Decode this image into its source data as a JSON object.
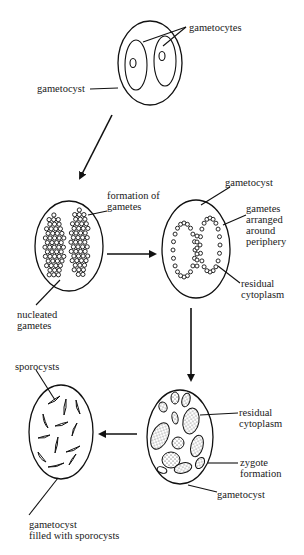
{
  "diagram": {
    "stages": [
      {
        "id": "stage-1",
        "labels": {
          "gametocytes": "gametocytes",
          "gametocyst": "gametocyst"
        }
      },
      {
        "id": "stage-2",
        "labels": {
          "formation": "formation of\ngametes",
          "nucleated": "nucleated\ngametes"
        }
      },
      {
        "id": "stage-3",
        "labels": {
          "gametocyst": "gametocyst",
          "gametes_periphery": "gametes\narranged\naround\nperiphery",
          "residual": "residual\ncytoplasm"
        }
      },
      {
        "id": "stage-4",
        "labels": {
          "residual": "residual\ncytoplasm",
          "zygote": "zygote\nformation",
          "gametocyst": "gametocyst"
        }
      },
      {
        "id": "stage-5",
        "labels": {
          "sporocysts": "sporocysts",
          "filled": "gametocyst\nfilled with sporocysts"
        }
      }
    ],
    "flow": [
      "stage-1",
      "stage-2",
      "stage-3",
      "stage-4",
      "stage-5"
    ]
  }
}
